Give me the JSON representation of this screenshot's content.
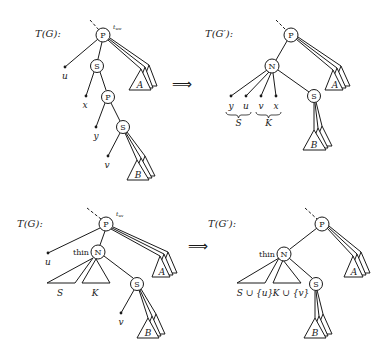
{
  "panels": {
    "top_left": {
      "title": "T(G):",
      "root_label": "P",
      "edge_label": "t_uw",
      "nodes": [
        "P",
        "S",
        "P",
        "S"
      ],
      "leaves": [
        "u",
        "x",
        "y",
        "v"
      ],
      "subtrees": [
        "A",
        "B"
      ]
    },
    "top_right": {
      "title": "T(G′):",
      "root_label": "P",
      "nodes": [
        "P",
        "N",
        "S"
      ],
      "leaves": [
        "y",
        "u",
        "v",
        "x"
      ],
      "brace_labels": [
        "S",
        "K"
      ],
      "subtrees": [
        "A",
        "B"
      ]
    },
    "bottom_left": {
      "title": "T(G):",
      "root_label": "P",
      "edge_label": "t_uv",
      "nodes": [
        "P",
        "N",
        "S"
      ],
      "node_annotation": "thin",
      "leaves": [
        "u",
        "v"
      ],
      "subtrees": [
        "S",
        "K",
        "A",
        "B"
      ]
    },
    "bottom_right": {
      "title": "T(G′):",
      "root_label": "P",
      "nodes": [
        "P",
        "N",
        "S"
      ],
      "node_annotation": "thin",
      "subtrees": [
        "S ∪ {u}",
        "K ∪ {v}",
        "A",
        "B"
      ]
    }
  },
  "arrows": [
    "⟹",
    "⟹"
  ]
}
